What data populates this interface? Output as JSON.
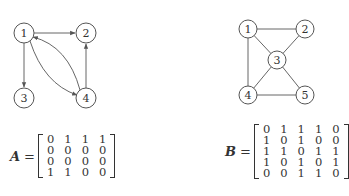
{
  "graph_a": {
    "type": "directed",
    "nodes": [
      {
        "id": "1",
        "x": 24,
        "y": 33
      },
      {
        "id": "2",
        "x": 86,
        "y": 33
      },
      {
        "id": "3",
        "x": 24,
        "y": 98
      },
      {
        "id": "4",
        "x": 86,
        "y": 98
      }
    ],
    "edges": [
      {
        "from": "1",
        "to": "2"
      },
      {
        "from": "1",
        "to": "3"
      },
      {
        "from": "1",
        "to": "4"
      },
      {
        "from": "4",
        "to": "1"
      },
      {
        "from": "4",
        "to": "2"
      }
    ]
  },
  "graph_b": {
    "type": "undirected",
    "nodes": [
      {
        "id": "1",
        "x": 248,
        "y": 29
      },
      {
        "id": "2",
        "x": 305,
        "y": 29
      },
      {
        "id": "3",
        "x": 277,
        "y": 60
      },
      {
        "id": "4",
        "x": 248,
        "y": 95
      },
      {
        "id": "5",
        "x": 305,
        "y": 95
      }
    ],
    "edges": [
      {
        "from": "1",
        "to": "2"
      },
      {
        "from": "1",
        "to": "3"
      },
      {
        "from": "1",
        "to": "4"
      },
      {
        "from": "2",
        "to": "3"
      },
      {
        "from": "3",
        "to": "4"
      },
      {
        "from": "3",
        "to": "5"
      },
      {
        "from": "4",
        "to": "5"
      }
    ]
  },
  "matrix_a": {
    "label": "A",
    "equals": "=",
    "rows": [
      [
        "0",
        "1",
        "1",
        "1"
      ],
      [
        "0",
        "0",
        "0",
        "0"
      ],
      [
        "0",
        "0",
        "0",
        "0"
      ],
      [
        "1",
        "1",
        "0",
        "0"
      ]
    ]
  },
  "matrix_b": {
    "label": "B",
    "equals": "=",
    "rows": [
      [
        "0",
        "1",
        "1",
        "1",
        "0"
      ],
      [
        "1",
        "0",
        "1",
        "0",
        "0"
      ],
      [
        "1",
        "1",
        "0",
        "1",
        "1"
      ],
      [
        "1",
        "0",
        "1",
        "0",
        "1"
      ],
      [
        "0",
        "0",
        "1",
        "1",
        "0"
      ]
    ]
  }
}
